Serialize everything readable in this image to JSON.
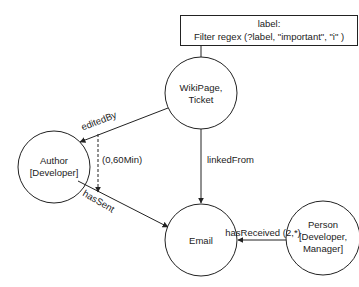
{
  "filter_box": {
    "line1": "label:",
    "line2": "Filter regex (?label, \"important\", \"i\" )"
  },
  "nodes": [
    {
      "id": "wikipage",
      "lines": [
        "WikiPage,",
        "Ticket"
      ]
    },
    {
      "id": "author",
      "lines": [
        "Author",
        "[Developer]"
      ]
    },
    {
      "id": "email",
      "lines": [
        "Email"
      ]
    },
    {
      "id": "person",
      "lines": [
        "Person",
        "[Developer,",
        "Manager]"
      ]
    }
  ],
  "edges": [
    {
      "id": "editedBy",
      "label": "editedBy",
      "from": "wikipage",
      "to": "author",
      "style": "solid"
    },
    {
      "id": "linkedFrom",
      "label": "linkedFrom",
      "from": "wikipage",
      "to": "email",
      "style": "solid"
    },
    {
      "id": "hasSent",
      "label": "hasSent",
      "from": "author",
      "to": "email",
      "style": "solid"
    },
    {
      "id": "hasReceived",
      "label": "hasReceived (2,*)",
      "from": "person",
      "to": "email",
      "style": "solid"
    },
    {
      "id": "timeConstraint",
      "label": "(0,60Min)",
      "from": "editedBy",
      "to": "hasSent",
      "style": "dashed"
    }
  ],
  "colors": {
    "stroke": "#222222",
    "background": "#ffffff",
    "text": "#222222"
  }
}
